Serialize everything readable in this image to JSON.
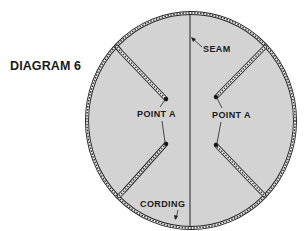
{
  "title": "DIAGRAM 6",
  "labels": {
    "seam": "SEAM",
    "point_a_left": "POINT A",
    "point_a_right": "POINT A",
    "cording": "CORDING"
  },
  "colors": {
    "fill": "#d3d3d3",
    "stroke": "#222222",
    "cording_inner": "#f2f2f2",
    "background": "#ffffff"
  },
  "shape": {
    "type": "circular-panel",
    "center": [
      191,
      120
    ],
    "rx": 104,
    "ry": 107
  },
  "darts": [
    {
      "name": "upper-left",
      "edge": [
        117,
        47
      ],
      "corner": [
        121,
        52
      ],
      "point": [
        166,
        99
      ]
    },
    {
      "name": "lower-left",
      "edge": [
        119,
        196
      ],
      "corner": [
        124,
        191
      ],
      "point": [
        166,
        144
      ]
    },
    {
      "name": "upper-right",
      "edge": [
        265,
        47
      ],
      "corner": [
        260,
        52
      ],
      "point": [
        216,
        97
      ]
    },
    {
      "name": "lower-right",
      "edge": [
        264,
        195
      ],
      "corner": [
        259,
        190
      ],
      "point": [
        216,
        145
      ]
    }
  ]
}
